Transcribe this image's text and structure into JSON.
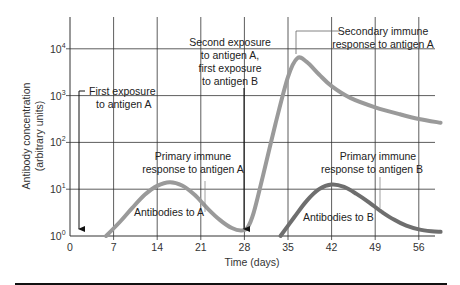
{
  "chart_data": {
    "type": "line",
    "title": "",
    "xlabel": "Time (days)",
    "ylabel": "Antibody concentration (arbitrary units)",
    "y_scale": "log",
    "xlim": [
      0,
      60
    ],
    "ylim_log10": [
      0,
      4.6
    ],
    "x_ticks": [
      0,
      7,
      14,
      21,
      28,
      35,
      42,
      49,
      56
    ],
    "y_ticks": [
      {
        "base": "10",
        "exp": "0",
        "value": 1
      },
      {
        "base": "10",
        "exp": "1",
        "value": 10
      },
      {
        "base": "10",
        "exp": "2",
        "value": 100
      },
      {
        "base": "10",
        "exp": "3",
        "value": 1000
      },
      {
        "base": "10",
        "exp": "4",
        "value": 10000
      }
    ],
    "grid": true,
    "series": [
      {
        "name": "Antibodies to A",
        "color": "#9a9a9a",
        "x": [
          5.8,
          8,
          10,
          12,
          14,
          16,
          18,
          20,
          22,
          24,
          26,
          27.5,
          28.5,
          29.5,
          31,
          33,
          35,
          36.5,
          38,
          40,
          42,
          45,
          49,
          53,
          56,
          59.5
        ],
        "log10y": [
          0,
          0.3,
          0.6,
          0.88,
          1.07,
          1.15,
          1.08,
          0.88,
          0.6,
          0.35,
          0.17,
          0.12,
          0.18,
          0.5,
          1.3,
          2.4,
          3.4,
          3.8,
          3.72,
          3.45,
          3.2,
          2.95,
          2.75,
          2.6,
          2.5,
          2.42
        ]
      },
      {
        "name": "Antibodies to B",
        "color": "#6e6e6e",
        "x": [
          33.8,
          36,
          38,
          40,
          42,
          44,
          46,
          48,
          50,
          52,
          54,
          56,
          58,
          59.5
        ],
        "log10y": [
          0,
          0.4,
          0.75,
          1.0,
          1.1,
          1.05,
          0.9,
          0.72,
          0.52,
          0.35,
          0.22,
          0.14,
          0.1,
          0.09
        ]
      }
    ],
    "annotations": [
      {
        "id": "first_exposure",
        "lines": [
          "First exposure",
          "to antigen A"
        ],
        "arrow_x_day": 1.4
      },
      {
        "id": "second_exposure",
        "lines": [
          "Second exposure",
          "to antigen A,",
          "first exposure",
          "to antigen B"
        ],
        "arrow_x_day": 28
      },
      {
        "id": "secondary_A",
        "lines": [
          "Secondary immune",
          "response to antigen A"
        ]
      },
      {
        "id": "primary_A",
        "lines": [
          "Primary immune",
          "response to antigen A"
        ]
      },
      {
        "id": "primary_B",
        "lines": [
          "Primary immune",
          "response to antigen B"
        ]
      },
      {
        "id": "label_A",
        "lines": [
          "Antibodies to A"
        ]
      },
      {
        "id": "label_B",
        "lines": [
          "Antibodies to B"
        ]
      }
    ]
  },
  "labels": {
    "ylabel_line1": "Antibody concentration",
    "ylabel_line2": "(arbitrary units)",
    "xlabel": "Time (days)",
    "first_exposure_1": "First exposure",
    "first_exposure_2": "to antigen A",
    "second_exposure_1": "Second exposure",
    "second_exposure_2": "to antigen A,",
    "second_exposure_3": "first exposure",
    "second_exposure_4": "to antigen B",
    "secondary_A_1": "Secondary immune",
    "secondary_A_2": "response to antigen A",
    "primary_A_1": "Primary immune",
    "primary_A_2": "response to antigen A",
    "primary_B_1": "Primary immune",
    "primary_B_2": "response to antigen B",
    "antibodies_A": "Antibodies to A",
    "antibodies_B": "Antibodies to B"
  }
}
